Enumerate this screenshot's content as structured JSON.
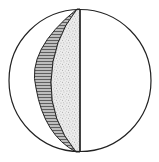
{
  "diagram": {
    "colors": {
      "background": "#ffffff",
      "stroke": "#222222",
      "hatch": "#555555",
      "stipple": "#888888"
    },
    "circle": {
      "cx": 80,
      "cy": 80,
      "r": 71
    },
    "regions": [
      {
        "name": "hatched-crescent",
        "fill": "hatched"
      },
      {
        "name": "stippled-region",
        "fill": "stippled"
      },
      {
        "name": "right-half",
        "fill": "blank"
      }
    ]
  }
}
